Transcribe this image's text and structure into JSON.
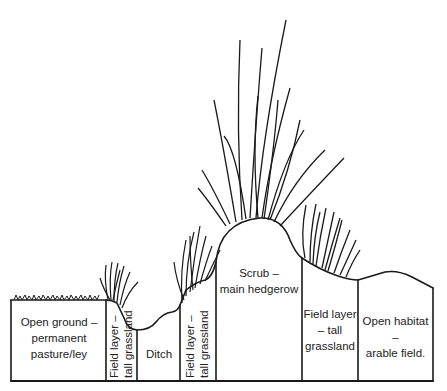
{
  "diagram": {
    "type": "hedgerow cross-section",
    "zones": [
      {
        "id": "open-ground",
        "lines": [
          "Open ground –",
          "permanent",
          "pasture/ley"
        ],
        "orientation": "horizontal"
      },
      {
        "id": "field-layer-left",
        "lines": [
          "Field layer –",
          "tall grassland"
        ],
        "orientation": "vertical"
      },
      {
        "id": "ditch",
        "lines": [
          "Ditch"
        ],
        "orientation": "horizontal"
      },
      {
        "id": "field-layer-mid",
        "lines": [
          "Field layer –",
          "tall grassland"
        ],
        "orientation": "vertical"
      },
      {
        "id": "scrub",
        "lines": [
          "Scrub –",
          "main hedgerow"
        ],
        "orientation": "horizontal"
      },
      {
        "id": "field-layer-right",
        "lines": [
          "Field layer",
          "– tall",
          "grassland"
        ],
        "orientation": "horizontal"
      },
      {
        "id": "open-habitat",
        "lines": [
          "Open habitat –",
          "arable field."
        ],
        "orientation": "horizontal"
      }
    ]
  },
  "colors": {
    "ink": "#1a1a1a",
    "background": "#ffffff"
  }
}
